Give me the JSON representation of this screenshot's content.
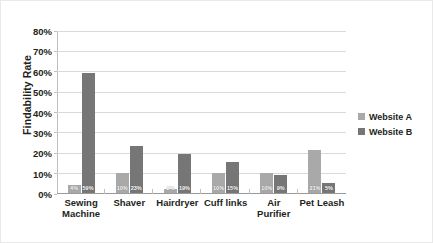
{
  "chart_data": {
    "type": "bar",
    "title": "",
    "subtitle": "",
    "xlabel": "",
    "ylabel": "Findability Rate",
    "ylim": [
      0,
      80
    ],
    "y_tick_labels": [
      "0%",
      "10%",
      "20%",
      "30%",
      "40%",
      "50%",
      "60%",
      "70%",
      "80%"
    ],
    "y_tick_values": [
      0,
      10,
      20,
      30,
      40,
      50,
      60,
      70,
      80
    ],
    "grid": true,
    "legend_position": "right",
    "categories": [
      "Sewing Machine",
      "Shaver",
      "Hairdryer",
      "Cuff links",
      "Air Purifier",
      "Pet Leash"
    ],
    "series": [
      {
        "name": "Website A",
        "color": "#a9a9a9",
        "values": [
          4,
          10,
          2,
          10,
          10,
          21
        ],
        "labels": [
          "4%",
          "10%",
          "2%",
          "10%",
          "10%",
          "21%"
        ]
      },
      {
        "name": "Website B",
        "color": "#767676",
        "values": [
          59,
          23,
          19,
          15,
          9,
          5
        ],
        "labels": [
          "59%",
          "23%",
          "19%",
          "15%",
          "9%",
          "5%"
        ]
      }
    ]
  },
  "legend": {
    "items": [
      {
        "label": "Website A",
        "color": "#a9a9a9"
      },
      {
        "label": "Website B",
        "color": "#767676"
      }
    ]
  },
  "colors": {
    "series_a": "#a9a9a9",
    "series_b": "#767676",
    "gridline": "#d9d9d9",
    "axis": "#bfbfbf",
    "text": "#231f20",
    "background": "#ffffff"
  }
}
